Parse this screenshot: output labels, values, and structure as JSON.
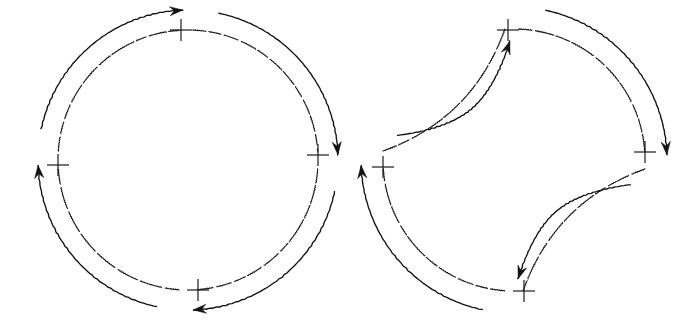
{
  "figure": {
    "background_color": "#ffffff",
    "line_color": "#1b1b1b",
    "arrow_color": "#121212",
    "canvas": {
      "width": 695,
      "height": 322
    },
    "panels": [
      {
        "id": "left-panel",
        "name": "circular-loop",
        "shape_type": "circle",
        "center": {
          "x": 188,
          "y": 160
        },
        "radius": 130,
        "rotation_sense": "clockwise",
        "segment_style": "dashed-convex",
        "markers": [
          {
            "name": "marker-top",
            "x": 181,
            "y": 30,
            "angle_deg": 270,
            "glyph": "plus-cross",
            "arm": 11
          },
          {
            "name": "marker-right",
            "x": 318,
            "y": 155,
            "angle_deg": 0,
            "glyph": "plus-cross",
            "arm": 11
          },
          {
            "name": "marker-bottom",
            "x": 198,
            "y": 290,
            "angle_deg": 90,
            "glyph": "plus-cross",
            "arm": 11
          },
          {
            "name": "marker-left",
            "x": 58,
            "y": 165,
            "angle_deg": 180,
            "glyph": "plus-cross",
            "arm": 11
          }
        ],
        "arcs": [
          {
            "name": "arc-top-right",
            "from_deg": 272,
            "to_deg": 356,
            "curvature": "convex"
          },
          {
            "name": "arc-right-bottom",
            "from_deg": 4,
            "to_deg": 86,
            "curvature": "convex"
          },
          {
            "name": "arc-bottom-left",
            "from_deg": 94,
            "to_deg": 176,
            "curvature": "convex"
          },
          {
            "name": "arc-left-top",
            "from_deg": 184,
            "to_deg": 266,
            "curvature": "convex"
          }
        ],
        "arrows": [
          {
            "name": "arrow-top-left-quadrant",
            "direction": "up-right",
            "points_toward": "marker-top",
            "offset": 20
          },
          {
            "name": "arrow-top-right-quadrant",
            "direction": "down",
            "points_toward": "marker-right",
            "offset": 20
          },
          {
            "name": "arrow-bottom-right-quadrant",
            "direction": "left",
            "points_toward": "marker-bottom",
            "offset": 20
          },
          {
            "name": "arrow-bottom-left-quadrant",
            "direction": "up",
            "points_toward": "marker-left",
            "offset": 20
          }
        ]
      },
      {
        "id": "right-panel",
        "name": "four-petal-loop",
        "shape_type": "alternating-arc-astroid",
        "center": {
          "x": 514,
          "y": 160
        },
        "radius": 131,
        "rotation_sense": "clockwise",
        "segment_style": "alternating-convex-concave",
        "markers": [
          {
            "name": "marker-top",
            "x": 508,
            "y": 30,
            "angle_deg": 270,
            "glyph": "plus-cross",
            "arm": 11
          },
          {
            "name": "marker-right",
            "x": 645,
            "y": 152,
            "angle_deg": 0,
            "glyph": "plus-cross",
            "arm": 11
          },
          {
            "name": "marker-bottom",
            "x": 524,
            "y": 291,
            "angle_deg": 90,
            "glyph": "plus-cross",
            "arm": 11
          },
          {
            "name": "marker-left",
            "x": 383,
            "y": 167,
            "angle_deg": 180,
            "glyph": "plus-cross",
            "arm": 11
          }
        ],
        "arcs": [
          {
            "name": "arc-left-top",
            "from_deg": 184,
            "to_deg": 266,
            "curvature": "concave"
          },
          {
            "name": "arc-top-right",
            "from_deg": 272,
            "to_deg": 356,
            "curvature": "convex"
          },
          {
            "name": "arc-right-bottom",
            "from_deg": 4,
            "to_deg": 86,
            "curvature": "concave"
          },
          {
            "name": "arc-bottom-left",
            "from_deg": 94,
            "to_deg": 176,
            "curvature": "convex"
          }
        ],
        "arrows": [
          {
            "name": "arrow-upper-left-quadrant",
            "direction": "up",
            "points_toward": "marker-top",
            "offset": 22
          },
          {
            "name": "arrow-upper-right-quadrant",
            "direction": "down",
            "points_toward": "marker-right",
            "offset": 22
          },
          {
            "name": "arrow-lower-right-quadrant",
            "direction": "down",
            "points_toward": "marker-bottom",
            "offset": 22
          },
          {
            "name": "arrow-lower-left-quadrant",
            "direction": "up",
            "points_toward": "marker-left",
            "offset": 22
          }
        ]
      }
    ]
  }
}
